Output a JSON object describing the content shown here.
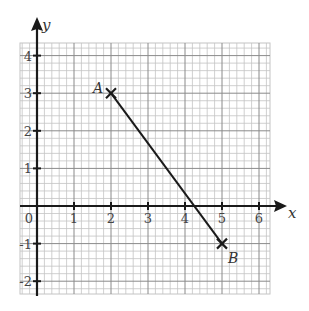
{
  "chart_data": {
    "type": "line",
    "title": "",
    "xlabel": "x",
    "ylabel": "y",
    "xlim": [
      -0.45,
      6.25
    ],
    "ylim": [
      -2.35,
      4.3
    ],
    "grid": true,
    "minor_grid_step": 0.2,
    "x_ticks": [
      "0",
      "1",
      "2",
      "3",
      "4",
      "5",
      "6"
    ],
    "y_ticks": [
      "-2",
      "-1",
      "1",
      "2",
      "3",
      "4"
    ],
    "points": [
      {
        "label": "A",
        "x": 2,
        "y": 3
      },
      {
        "label": "B",
        "x": 5,
        "y": -1
      }
    ],
    "series": [
      {
        "name": "AB",
        "x": [
          2,
          5
        ],
        "y": [
          3,
          -1
        ]
      }
    ]
  },
  "labels": {
    "x_axis": "x",
    "y_axis": "y",
    "origin": "0",
    "point_a": "A",
    "point_b": "B"
  },
  "colors": {
    "major_grid": "#8a8a8a",
    "minor_grid": "#c4c4c4",
    "axis": "#1a1a1a",
    "line": "#1a1a1a",
    "label": "#444444"
  }
}
